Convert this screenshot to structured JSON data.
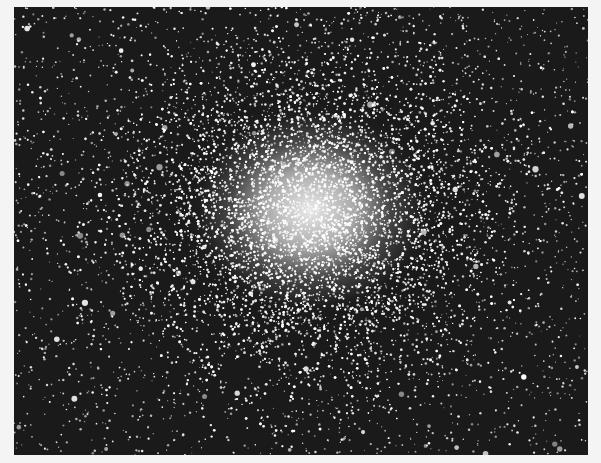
{
  "image": {
    "subject": "globular star cluster photograph",
    "style": "black-and-white astronomical plate",
    "frame": {
      "left": 14,
      "top": 7,
      "width": 574,
      "height": 448
    },
    "colors": {
      "border": "#f4f4f4",
      "sky": "#1a1a1a",
      "stars": "#ffffff"
    },
    "core": {
      "cx": 296,
      "cy": 203,
      "rx": 95,
      "ry": 82
    },
    "halo": {
      "rx": 230,
      "ry": 200
    },
    "background_star_count": 2600,
    "cluster_star_count": 9000
  }
}
